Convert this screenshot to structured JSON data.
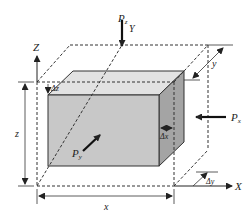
{
  "diagram": {
    "axes": {
      "x_axis_label": "X",
      "y_axis_label": "Y",
      "z_axis_label": "Z"
    },
    "dimensions": {
      "x_label": "x",
      "y_label": "y",
      "z_label": "z"
    },
    "increments": {
      "dx_label": "Δx",
      "dy_label": "Δy",
      "dz_label": "Δz"
    },
    "loads": {
      "pz_main": "P",
      "pz_sub": "z",
      "px_main": "P",
      "px_sub": "x",
      "py_main": "P",
      "py_sub": "y"
    },
    "colors": {
      "front_face": "#c8c8c8",
      "top_face": "#e2e2e2",
      "side_face": "#a4a4a4",
      "line": "#222222"
    }
  }
}
